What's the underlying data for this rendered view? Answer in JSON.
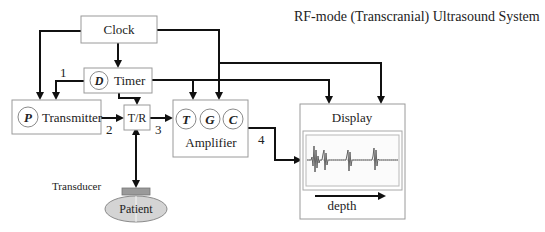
{
  "title": "RF-mode (Transcranial) Ultrasound System",
  "blocks": {
    "clock": {
      "label": "Clock"
    },
    "timer": {
      "label": "Timer",
      "symbol": "D"
    },
    "transmitter": {
      "label": "Transmitter",
      "symbol": "P"
    },
    "tr_switch": {
      "label": "T/R"
    },
    "amplifier": {
      "label": "Amplifier",
      "symbols": [
        "T",
        "G",
        "C"
      ]
    },
    "display": {
      "label": "Display",
      "axis_label": "depth"
    },
    "transducer": {
      "label": "Transducer"
    },
    "patient": {
      "label": "Patient"
    }
  },
  "signal_labels": [
    "1",
    "2",
    "3",
    "4"
  ],
  "colors": {
    "line": "#111111",
    "box_border": "#9a9a9a",
    "patient_fill": "#d4d4d4",
    "transducer_fill": "#9a9a9a",
    "waveform": "#555555"
  }
}
